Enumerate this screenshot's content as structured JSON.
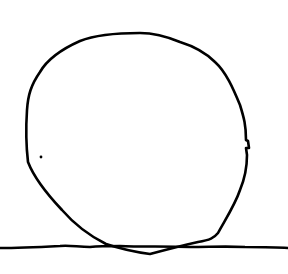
{
  "drawing": {
    "description": "Hand-drawn circle resting on a horizontal ground line",
    "background_color": "#ffffff",
    "stroke_color": "#000000",
    "stroke_width": 2.6,
    "circle_path": "M140,33 C120,33 95,35 80,41 C62,49 48,58 40,72 C31,85 28,95 27,110 C26,125 26,145 28,162 C33,175 45,192 62,210 C75,225 90,236 106,244 C118,248 135,252 150,254 C165,250 180,246 198,242 C210,240 214,238 218,233 C225,220 235,205 240,190 C245,178 247,168 247,155 L246,148 L249,148 L248,141 L246,140 C246,125 244,118 240,105 C233,88 226,72 215,62 C205,52 193,46 180,42 C168,37 155,33 140,33 Z",
    "ground_line_path": "M0,248 C20,248 40,247 60,246 C70,245 78,247 90,247 C100,246 110,246 120,246 C140,247 170,246 190,247 C210,247 225,246 245,247 C260,247 275,247 288,248",
    "dot": {
      "cx": 41,
      "cy": 157,
      "r": 1.4
    }
  }
}
